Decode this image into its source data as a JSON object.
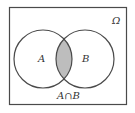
{
  "diagram": {
    "type": "venn",
    "universe_label": "Ω",
    "sets": [
      {
        "label": "A"
      },
      {
        "label": "B"
      }
    ],
    "highlighted_region": "A ∩ B",
    "caption": "A∩B",
    "colors": {
      "stroke": "#4a4a4a",
      "intersection_fill": "#bdbdbd",
      "background": "#ffffff"
    }
  }
}
